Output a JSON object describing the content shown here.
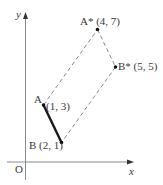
{
  "diagram": {
    "type": "coordinate-transformation",
    "colors": {
      "axis": "#8a8a8a",
      "segment": "#1a1a1a",
      "dashed": "#7a7a7a",
      "point": "#111111",
      "text": "#3a3a3a"
    },
    "axes": {
      "x_label": "x",
      "y_label": "y",
      "origin_label": "O"
    },
    "points": [
      {
        "name": "A",
        "coords": [
          1,
          3
        ],
        "label": "A",
        "coord_label": "(1, 3)"
      },
      {
        "name": "B",
        "coords": [
          2,
          1
        ],
        "label": "B (2, 1)"
      },
      {
        "name": "A*",
        "coords": [
          4,
          7
        ],
        "label": "A* (4, 7)"
      },
      {
        "name": "B*",
        "coords": [
          5,
          5
        ],
        "label": "B* (5, 5)"
      }
    ],
    "segments": [
      {
        "from": "A",
        "to": "B",
        "style": "solid-thick"
      },
      {
        "from": "A",
        "to": "A*",
        "style": "dashed"
      },
      {
        "from": "A*",
        "to": "B*",
        "style": "dashed"
      },
      {
        "from": "B*",
        "to": "B",
        "style": "dashed"
      }
    ]
  }
}
